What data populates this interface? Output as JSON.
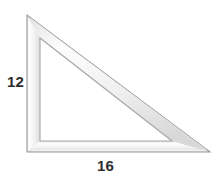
{
  "figure": {
    "shape_name": "right-triangle-ruler",
    "background_color": "#ffffff",
    "band_fill_color": "#f5f5f5",
    "band_edge_color": "#9a9a9a",
    "band_highlight_color": "#fcfcfc",
    "band_shadow_color": "#c9c9c9",
    "label_color": "#2e2e2e",
    "outer_triangle": {
      "apex": [
        27,
        15
      ],
      "bottom_left": [
        27,
        152
      ],
      "bottom_right": [
        210,
        152
      ]
    },
    "inner_triangle": {
      "apex": [
        40,
        38
      ],
      "bottom_left": [
        40,
        141
      ],
      "bottom_right": [
        172,
        141
      ]
    },
    "labels": {
      "vertical_leg": "12",
      "horizontal_leg": "16"
    },
    "measurements": [
      {
        "side": "vertical-leg",
        "value": "12"
      },
      {
        "side": "horizontal-leg",
        "value": "16"
      }
    ]
  }
}
